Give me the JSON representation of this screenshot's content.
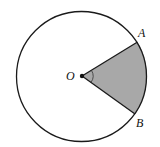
{
  "diagram": {
    "type": "circle-sector",
    "center_label": "O",
    "points": [
      {
        "label": "A"
      },
      {
        "label": "B"
      }
    ],
    "shaded_region": "sector AOB",
    "angle_marked": "AOB",
    "colors": {
      "stroke": "#1a1a1a",
      "sector_fill": "#a8a8a8",
      "background": "#ffffff"
    }
  }
}
